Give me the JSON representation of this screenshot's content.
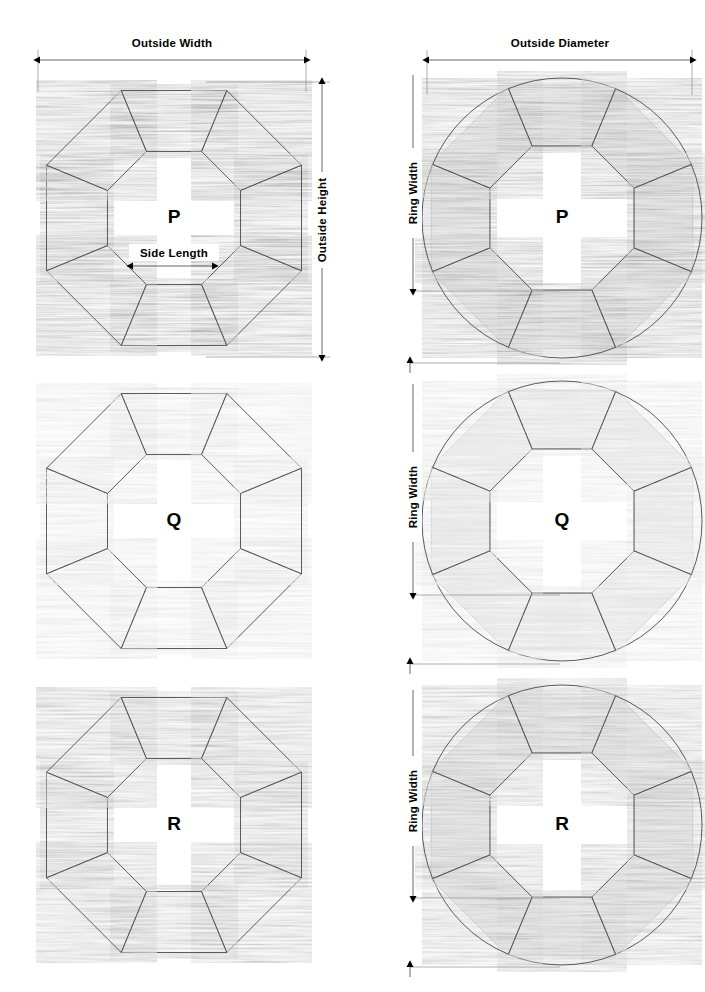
{
  "page": {
    "background": "#ffffff",
    "width": 705,
    "height": 992
  },
  "labels": {
    "outside_width": "Outside Width",
    "outside_height": "Outside Height",
    "side_length": "Side Length",
    "outside_diameter": "Outside Diameter",
    "ring_width": "Ring Width"
  },
  "figures": [
    {
      "id": "p-octagon",
      "letter": "P",
      "column": "left",
      "row": 1,
      "shape": "octagon-ring",
      "wood_tone": "dark",
      "dimensions": [
        "Outside Width",
        "Outside Height",
        "Side Length"
      ]
    },
    {
      "id": "p-round",
      "letter": "P",
      "column": "right",
      "row": 1,
      "shape": "round-ring",
      "wood_tone": "dark",
      "dimensions": [
        "Outside Diameter",
        "Ring Width"
      ]
    },
    {
      "id": "q-octagon",
      "letter": "Q",
      "column": "left",
      "row": 2,
      "shape": "octagon-ring",
      "wood_tone": "light",
      "dimensions": []
    },
    {
      "id": "q-round",
      "letter": "Q",
      "column": "right",
      "row": 2,
      "shape": "round-ring",
      "wood_tone": "light",
      "dimensions": [
        "Ring Width"
      ]
    },
    {
      "id": "r-octagon",
      "letter": "R",
      "column": "left",
      "row": 3,
      "shape": "octagon-ring",
      "wood_tone": "medium",
      "dimensions": []
    },
    {
      "id": "r-round",
      "letter": "R",
      "column": "right",
      "row": 3,
      "shape": "round-ring",
      "wood_tone": "medium",
      "dimensions": [
        "Ring Width"
      ]
    }
  ],
  "colors": {
    "ghost_fill": "#e8e8e8",
    "ghost_stroke": "#bdbdbd",
    "dim_line": "#555555",
    "ext_line": "#999999",
    "segment_edge": "#3a3a3a",
    "wood_dark": "#8a8a8a",
    "wood_light": "#c9c9c9",
    "wood_medium": "#9a9a9a",
    "text": "#000000"
  }
}
